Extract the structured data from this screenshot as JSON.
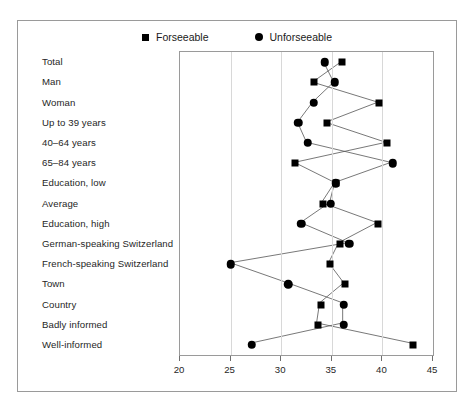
{
  "legend": {
    "items": [
      {
        "label": "Forseeable",
        "marker": "square-marker",
        "color": "#000000"
      },
      {
        "label": "Unforseeable",
        "marker": "circle-marker",
        "color": "#000000"
      }
    ]
  },
  "axis": {
    "ticks": [
      "20",
      "25",
      "30",
      "35",
      "40",
      "45"
    ]
  },
  "chart_data": {
    "type": "line",
    "title": "",
    "xlabel": "",
    "ylabel": "",
    "xlim": [
      20,
      45
    ],
    "xticks": [
      20,
      25,
      30,
      35,
      40,
      45
    ],
    "grid": true,
    "orientation": "horizontal",
    "legend_position": "top-center",
    "categories": [
      "Total",
      "Man",
      "Woman",
      "Up to 39 years",
      "40–64 years",
      "65–84 years",
      "Education, low",
      "Average",
      "Education, high",
      "German-speaking Switzerland",
      "French-speaking Switzerland",
      "Town",
      "Country",
      "Badly informed",
      "Well-informed"
    ],
    "series": [
      {
        "name": "Forseeable",
        "marker": "square",
        "values": [
          36.0,
          33.2,
          39.7,
          34.5,
          40.5,
          31.4,
          35.4,
          34.1,
          39.6,
          35.8,
          34.8,
          36.3,
          33.9,
          33.6,
          43.0
        ]
      },
      {
        "name": "Unforseeable",
        "marker": "circle",
        "values": [
          34.3,
          35.3,
          33.2,
          31.7,
          32.6,
          41.0,
          35.4,
          34.9,
          32.0,
          36.7,
          25.0,
          30.7,
          36.2,
          36.2,
          27.1
        ]
      }
    ]
  }
}
